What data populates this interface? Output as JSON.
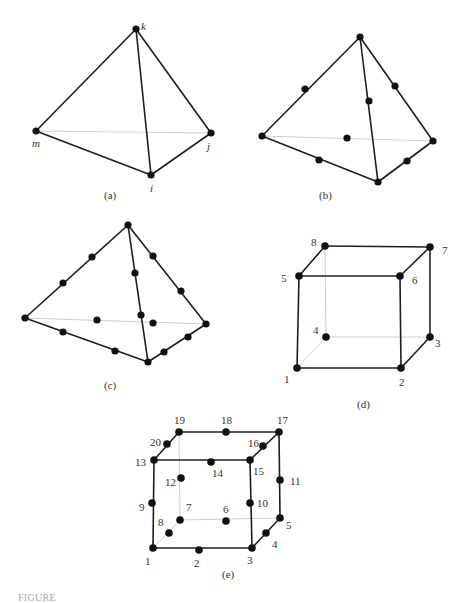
{
  "figure": {
    "panels": [
      {
        "id": "a",
        "caption": "(a)",
        "type": "four-node tetrahedron",
        "labels": {
          "k": "k",
          "m": "m",
          "j": "j",
          "i": "i"
        }
      },
      {
        "id": "b",
        "caption": "(b)",
        "type": "ten-node tetrahedron"
      },
      {
        "id": "c",
        "caption": "(c)",
        "type": "twenty-node tetrahedron"
      },
      {
        "id": "d",
        "caption": "(d)",
        "type": "eight-node hexahedron",
        "labels": [
          "1",
          "2",
          "3",
          "4",
          "5",
          "6",
          "7",
          "8"
        ]
      },
      {
        "id": "e",
        "caption": "(e)",
        "type": "twenty-node hexahedron",
        "labels": [
          "1",
          "2",
          "3",
          "4",
          "5",
          "6",
          "7",
          "8",
          "9",
          "10",
          "11",
          "12",
          "13",
          "14",
          "15",
          "16",
          "17",
          "18",
          "19",
          "20"
        ]
      }
    ],
    "colors": {
      "edge": "#1e1e1e",
      "hidden_edge": "#c8c8c8",
      "node": "#111111",
      "label": "#333333"
    }
  },
  "footer": {
    "caption_partial": "FIGURE"
  }
}
